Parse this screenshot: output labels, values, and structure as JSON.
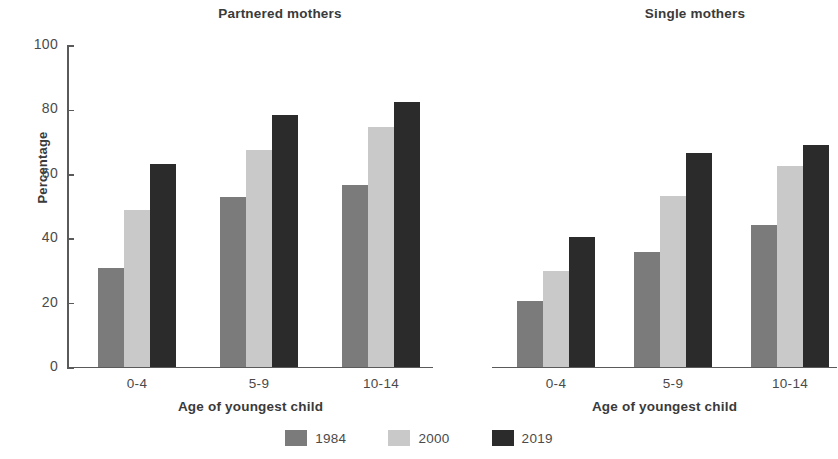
{
  "chart_data": {
    "type": "bar",
    "title": "",
    "panels": [
      {
        "title": "Partnered mothers",
        "xlabel": "Age of youngest child",
        "ylabel": "Percentage",
        "categories": [
          "0-4",
          "5-9",
          "10-14"
        ],
        "series": [
          {
            "name": "1984",
            "values": [
              30.5,
              52.6,
              56.4
            ]
          },
          {
            "name": "2000",
            "values": [
              48.6,
              67.2,
              74.5
            ]
          },
          {
            "name": "2019",
            "values": [
              63.0,
              78.0,
              82.2
            ]
          }
        ]
      },
      {
        "title": "Single mothers",
        "xlabel": "Age of youngest child",
        "ylabel": "Percentage",
        "categories": [
          "0-4",
          "5-9",
          "10-14"
        ],
        "series": [
          {
            "name": "1984",
            "values": [
              20.2,
              35.5,
              43.8
            ]
          },
          {
            "name": "2000",
            "values": [
              29.6,
              53.0,
              62.4
            ]
          },
          {
            "name": "2019",
            "values": [
              40.3,
              66.4,
              68.8
            ]
          }
        ]
      }
    ],
    "ylim": [
      0,
      100
    ],
    "yticks": [
      0,
      20,
      40,
      60,
      80,
      100
    ],
    "ytick_labels": [
      "0",
      "20",
      "40",
      "60",
      "80",
      "100"
    ],
    "grid": false,
    "legend": {
      "position": "bottom",
      "entries": [
        {
          "label": "1984",
          "color": "#7b7b7b"
        },
        {
          "label": "2000",
          "color": "#c9c9c9"
        },
        {
          "label": "2019",
          "color": "#2b2b2b"
        }
      ]
    },
    "colors": {
      "series_1984": "#7b7b7b",
      "series_2000": "#c9c9c9",
      "series_2019": "#2b2b2b",
      "axis": "#5a5a5a",
      "text": "#3a3a3a",
      "background": "#ffffff"
    }
  }
}
